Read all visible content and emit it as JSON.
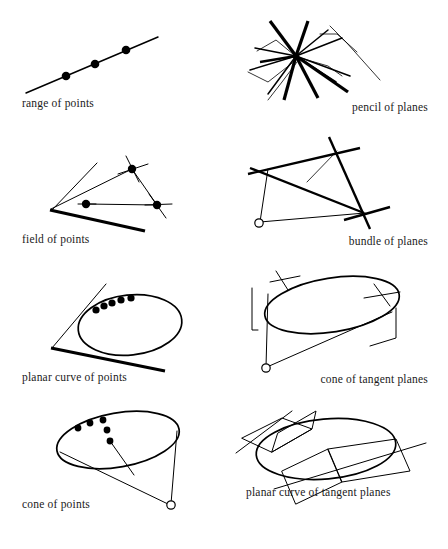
{
  "sheet": {
    "title": "Geometric primitives of projective geometry",
    "background_color": "#ffffff",
    "ink_color": "#000000",
    "columns": 2,
    "rows": 4
  },
  "panels": [
    {
      "id": "range-of-points",
      "caption": "range of points",
      "caption_align": "left",
      "figure": "straight line carrying three filled points"
    },
    {
      "id": "pencil-of-planes",
      "caption": "pencil of planes",
      "caption_align": "right",
      "figure": "several bent plane strips radiating from one common axis point"
    },
    {
      "id": "field-of-points",
      "caption": "field of points",
      "caption_align": "left",
      "figure": "wedge-shaped plane containing a triangle with three marked points"
    },
    {
      "id": "bundle-of-planes",
      "caption": "bundle of planes",
      "caption_align": "right",
      "figure": "open vertex joined to three crossing line pairs"
    },
    {
      "id": "planar-curve-of-points",
      "caption": "planar curve of points",
      "caption_align": "left",
      "figure": "ellipse lying in a wedge plane with points along its upper arc"
    },
    {
      "id": "cone-of-tangent-planes",
      "caption": "cone of tangent planes",
      "caption_align": "right",
      "figure": "cone over an ellipse with tangent plane markers on the rim"
    },
    {
      "id": "cone-of-points",
      "caption": "cone of points",
      "caption_align": "left",
      "figure": "cone over an ellipse with points marked on the rim and a generator arrow"
    },
    {
      "id": "planar-curve-of-tangent-planes",
      "caption": "planar curve of tangent planes",
      "caption_align": "left",
      "figure": "ellipse touched by two parallelogram tangent planes"
    }
  ]
}
